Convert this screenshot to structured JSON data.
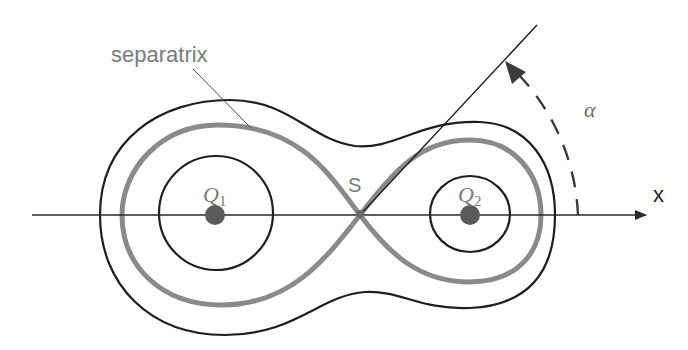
{
  "diagram": {
    "labels": {
      "separatrix": "separatrix",
      "saddle": "S",
      "charge1_main": "Q",
      "charge1_sub": "1",
      "charge2_main": "Q",
      "charge2_sub": "2",
      "x_axis": "x",
      "angle": "α"
    },
    "colors": {
      "background": "#ffffff",
      "contour": "#1e1e1e",
      "separatrix": "#8a8a8a",
      "charge": "#5a5a5a",
      "label_gray": "#7a7a7a",
      "axis": "#2a2a2a"
    },
    "elements": {
      "charges": [
        {
          "name": "Q1",
          "x": 215,
          "y": 215
        },
        {
          "name": "Q2",
          "x": 470,
          "y": 215
        }
      ],
      "saddle_point": {
        "name": "S",
        "x": 360,
        "y": 215
      },
      "angle_arc": {
        "center": "S",
        "from_axis": "x",
        "direction": "counter-clockwise"
      }
    }
  }
}
